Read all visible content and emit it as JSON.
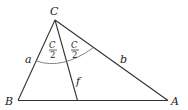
{
  "diagram": {
    "type": "triangle-angle-bisector",
    "colors": {
      "stroke": "#333333",
      "arc": "#666666",
      "text": "#222222",
      "background": "#ffffff"
    },
    "vertices": {
      "C": {
        "label": "C",
        "x": 55,
        "y": 20
      },
      "B": {
        "label": "B",
        "x": 18,
        "y": 100.5
      },
      "A": {
        "label": "A",
        "x": 168,
        "y": 100.5
      }
    },
    "bisector_foot": {
      "x": 77.5,
      "y": 100.5
    },
    "side_labels": {
      "a": "a",
      "b": "b",
      "f": "f"
    },
    "half_angle_label": {
      "numerator": "C",
      "denominator": "2"
    }
  }
}
